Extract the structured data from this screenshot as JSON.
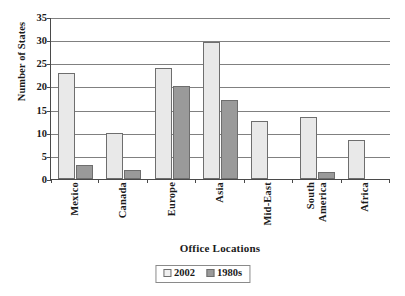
{
  "chart_data": {
    "type": "bar",
    "title": "",
    "xlabel": "Office Locations",
    "ylabel": "Number of States",
    "categories": [
      "Mexico",
      "Canada",
      "Europe",
      "Asia",
      "Mid-East",
      "South America",
      "Africa"
    ],
    "category_lines": [
      [
        "Mexico"
      ],
      [
        "Canada"
      ],
      [
        "Europe"
      ],
      [
        "Asia"
      ],
      [
        "Mid-East"
      ],
      [
        "South",
        "America"
      ],
      [
        "Africa"
      ]
    ],
    "series": [
      {
        "name": "2002",
        "color": "#e9e9e9",
        "values": [
          23,
          10,
          24,
          29.5,
          12.5,
          13.5,
          8.5
        ]
      },
      {
        "name": "1980s",
        "color": "#9a9a9a",
        "values": [
          3,
          2,
          20,
          17,
          0,
          1.5,
          0
        ]
      }
    ],
    "ylim": [
      0,
      35
    ],
    "yticks": [
      0,
      5,
      10,
      15,
      20,
      25,
      30,
      35
    ],
    "ytick_labels": [
      "0",
      "5",
      "10",
      "15",
      "20",
      "25",
      "30",
      "35"
    ],
    "grid": "horizontal",
    "legend_position": "bottom"
  },
  "legend": {
    "entries": [
      {
        "label": "2002"
      },
      {
        "label": "1980s"
      }
    ]
  }
}
